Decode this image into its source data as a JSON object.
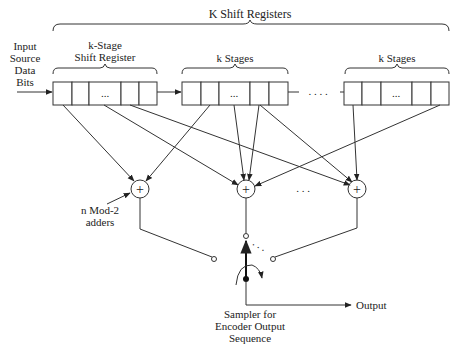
{
  "diagram": {
    "title_brace_label": "K Shift Registers",
    "input_label": [
      "Input",
      "Source",
      "Data",
      "Bits"
    ],
    "registers": [
      {
        "label_line1": "k-Stage",
        "label_line2": "Shift Register",
        "cells": [
          "",
          "",
          "...",
          "",
          ""
        ]
      },
      {
        "label_line1": "k Stages",
        "label_line2": "",
        "cells": [
          "",
          "",
          "...",
          "",
          ""
        ]
      },
      {
        "label_line1": "k Stages",
        "label_line2": "",
        "cells": [
          "",
          "",
          "...",
          "",
          ""
        ]
      }
    ],
    "between_registers_ellipsis": ". . . .",
    "adders": [
      {
        "symbol": "+"
      },
      {
        "symbol": "+"
      },
      {
        "symbol": "+"
      }
    ],
    "adders_ellipsis": ". . .",
    "adder_annotation": [
      "n Mod-2",
      "adders"
    ],
    "sampler_label": [
      "Sampler for",
      "Encoder Output",
      "Sequence"
    ],
    "output_label": "Output",
    "switch_ellipsis": ". . ."
  }
}
